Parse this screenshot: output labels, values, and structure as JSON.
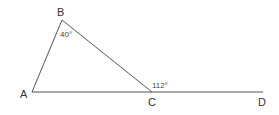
{
  "diagram": {
    "points": {
      "A": {
        "label": "A",
        "x": 32,
        "y": 92
      },
      "B": {
        "label": "B",
        "x": 62,
        "y": 20
      },
      "C": {
        "label": "C",
        "x": 152,
        "y": 92
      },
      "D": {
        "label": "D",
        "x": 263,
        "y": 92
      }
    },
    "angles": {
      "B": "40°",
      "BCD": "112°"
    },
    "line_color": "#555555"
  }
}
